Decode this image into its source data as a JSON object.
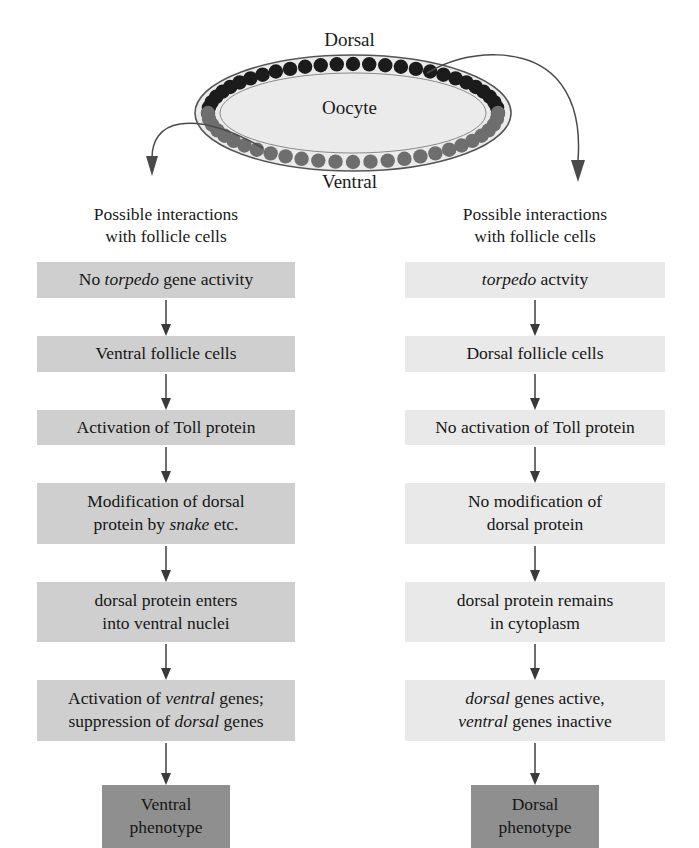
{
  "diagram": {
    "title_labels": {
      "dorsal": "Dorsal",
      "ventral": "Ventral",
      "oocyte": "Oocyte"
    },
    "colors": {
      "dorsal_cell": "#1b1b1b",
      "ventral_cell": "#6e6e6e",
      "oocyte_fill": "#ebebeb",
      "outline": "#555555",
      "left_box_bg": "#cfcfcf",
      "right_box_bg": "#e9e9e9",
      "terminal_box_bg": "#8f8f8f",
      "text": "#161616"
    },
    "cell_counts": {
      "dorsal_cells": 29,
      "ventral_cells": 27
    }
  },
  "left_column": {
    "heading": "Possible interactions\nwith follicle cells",
    "steps": [
      {
        "prefix": "No ",
        "italic": "torpedo",
        "suffix": " gene activity",
        "lines": 1
      },
      {
        "prefix": "Ventral follicle cells",
        "italic": "",
        "suffix": "",
        "lines": 1
      },
      {
        "prefix": "Activation of Toll protein",
        "italic": "",
        "suffix": "",
        "lines": 1
      },
      {
        "prefix": "Modification of dorsal\nprotein by ",
        "italic": "snake",
        "suffix": " etc.",
        "lines": 2
      },
      {
        "prefix": "dorsal protein enters\ninto ventral nuclei",
        "italic": "",
        "suffix": "",
        "lines": 2
      },
      {
        "prefix": "Activation of ",
        "italic": "ventral",
        "suffix": " genes;\nsuppression of ",
        "italic2": "dorsal",
        "suffix2": " genes",
        "lines": 2
      }
    ],
    "terminal": "Ventral\nphenotype"
  },
  "right_column": {
    "heading": "Possible interactions\nwith follicle cells",
    "steps": [
      {
        "prefix": "",
        "italic": "torpedo",
        "suffix": " actvity",
        "lines": 1
      },
      {
        "prefix": "Dorsal follicle cells",
        "italic": "",
        "suffix": "",
        "lines": 1
      },
      {
        "prefix": "No activation of Toll protein",
        "italic": "",
        "suffix": "",
        "lines": 1
      },
      {
        "prefix": "No modification of\ndorsal protein",
        "italic": "",
        "suffix": "",
        "lines": 2
      },
      {
        "prefix": "dorsal protein remains\nin cytoplasm",
        "italic": "",
        "suffix": "",
        "lines": 2
      },
      {
        "prefix": "",
        "italic": "dorsal",
        "suffix": " genes active,\n",
        "italic2": "ventral",
        "suffix2": " genes inactive",
        "lines": 2
      }
    ],
    "terminal": "Dorsal\nphenotype"
  }
}
